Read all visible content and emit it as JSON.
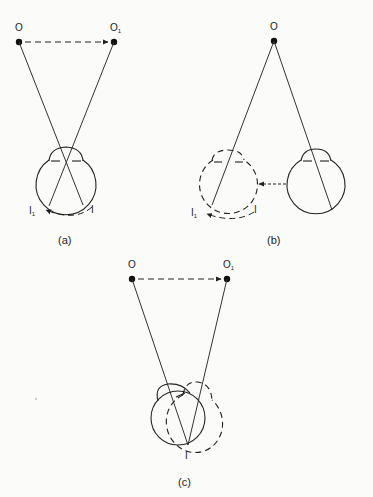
{
  "figure": {
    "panels": [
      {
        "id": "a",
        "caption": "(a)",
        "object_label": "O",
        "moved_object_label": "O",
        "moved_object_subscript": "1",
        "image_label": "I",
        "moved_image_label": "I",
        "moved_image_subscript": "1"
      },
      {
        "id": "b",
        "caption": "(b)",
        "object_label": "O",
        "image_label": "I",
        "moved_image_label": "I",
        "moved_image_subscript": "1"
      },
      {
        "id": "c",
        "caption": "(c)",
        "object_label": "O",
        "moved_object_label": "O",
        "moved_object_subscript": "1",
        "image_label": "I"
      }
    ]
  }
}
